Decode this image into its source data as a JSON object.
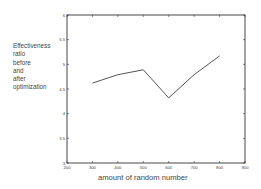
{
  "chart_data": {
    "type": "line",
    "title": "",
    "xlabel": "amount of random number",
    "ylabel_lines": [
      "Effectiveness",
      "ratio",
      "before",
      "and",
      "after",
      "optimization"
    ],
    "ylabel": "Effectiveness ratio before and after optimization",
    "x": [
      300,
      400,
      500,
      600,
      700,
      800
    ],
    "series": [
      {
        "name": "effectiveness ratio",
        "values": [
          4.62,
          4.79,
          4.89,
          4.32,
          4.79,
          5.17
        ]
      }
    ],
    "xlim": [
      200,
      900
    ],
    "ylim": [
      3,
      6
    ],
    "xticks": [
      200,
      300,
      400,
      500,
      600,
      700,
      800,
      900
    ],
    "yticks": [
      3,
      3.5,
      4,
      4.5,
      5,
      5.5,
      6
    ],
    "ytick_labels": [
      "3",
      "3.5",
      "4",
      "4.5",
      "5",
      "5.5",
      "6"
    ],
    "grid": false,
    "legend": null,
    "line_color": "#555555"
  }
}
